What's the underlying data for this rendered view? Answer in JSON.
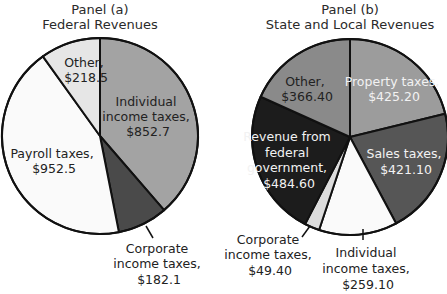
{
  "chart_data": [
    {
      "type": "pie",
      "title": "Panel (a)",
      "subtitle": "Federal Revenues",
      "categories": [
        "Individual income taxes",
        "Corporate income taxes",
        "Payroll taxes",
        "Other"
      ],
      "values": [
        852.7,
        182.1,
        952.5,
        218.5
      ],
      "labels": [
        "Individual income taxes, $852.7",
        "Corporate income taxes, $182.1",
        "Payroll taxes, $952.5",
        "Other, $218.5"
      ],
      "colors": [
        "#a3a3a3",
        "#4a4a4a",
        "#fafafa",
        "#e6e6e6"
      ],
      "start_angle": "top, clockwise"
    },
    {
      "type": "pie",
      "title": "Panel (b)",
      "subtitle": "State and Local Revenues",
      "categories": [
        "Property taxes",
        "Sales taxes",
        "Individual income taxes",
        "Corporate income taxes",
        "Revenue from federal government",
        "Other"
      ],
      "values": [
        425.2,
        421.1,
        259.1,
        49.4,
        484.6,
        366.4
      ],
      "labels": [
        "Property taxes, $425.20",
        "Sales taxes, $421.10",
        "Individual income taxes, $259.10",
        "Corporate income taxes, $49.40",
        "Revenue from federal government, $484.60",
        "Other, $366.40"
      ],
      "colors": [
        "#9c9c9c",
        "#565656",
        "#fafafa",
        "#dcdcdc",
        "#1c1c1c",
        "#8a8a8a"
      ],
      "start_angle": "top, clockwise"
    }
  ],
  "panel_a": {
    "title": "Panel (a)",
    "subtitle": "Federal Revenues",
    "labels": {
      "individual": [
        "Individual",
        "income taxes,",
        "$852.7"
      ],
      "corporate": [
        "Corporate",
        "income taxes,",
        "$182.1"
      ],
      "payroll": [
        "Payroll taxes,",
        "$952.5"
      ],
      "other": [
        "Other,",
        "$218.5"
      ]
    }
  },
  "panel_b": {
    "title": "Panel (b)",
    "subtitle": "State and Local Revenues",
    "labels": {
      "property": [
        "Property taxes,",
        "$425.20"
      ],
      "sales": [
        "Sales taxes,",
        "$421.10"
      ],
      "individual": [
        "Individual",
        "income taxes,",
        "$259.10"
      ],
      "corporate": [
        "Corporate",
        "income taxes,",
        "$49.40"
      ],
      "federal": [
        "Revenue from",
        "federal",
        "government,",
        "$484.60"
      ],
      "other": [
        "Other,",
        "$366.40"
      ]
    }
  }
}
